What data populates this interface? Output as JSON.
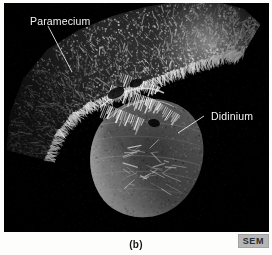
{
  "figure": {
    "caption": "(b)",
    "technique_badge": "SEM",
    "panel_background_color": "#000000",
    "page_background_color": "#fdfdfb",
    "label_text_color": "#f2f2f2",
    "badge_background_color": "#b6b6b6",
    "badge_text_color": "#2b2b2b"
  },
  "annotations": [
    {
      "id": "paramecium",
      "label": "Paramecium",
      "leader": {
        "x1": 48,
        "y1": 26,
        "x2": 72,
        "y2": 72
      }
    },
    {
      "id": "didinium",
      "label": "Didinium",
      "leader": {
        "x1": 204,
        "y1": 116,
        "x2": 178,
        "y2": 133
      }
    }
  ],
  "micrograph": {
    "subject": "Didinium nasutum ingesting a Paramecium",
    "organisms": [
      {
        "name": "Paramecium",
        "description": "elongated ciliated cell spanning upper-left to upper-right"
      },
      {
        "name": "Didinium",
        "description": "rounded barrel-shaped predator cell in lower-center"
      }
    ]
  }
}
